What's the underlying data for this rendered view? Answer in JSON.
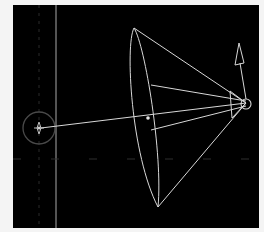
{
  "viewport": {
    "label": "3D Viewport - Spot Light",
    "background": "#000000",
    "wire_color": "#d8d8d8",
    "grid_color": "#6a6a6a"
  },
  "scene": {
    "light_type": "Spot Light",
    "target_label": "target",
    "apex_label": "spot-origin",
    "direction_label": "up-vector"
  }
}
